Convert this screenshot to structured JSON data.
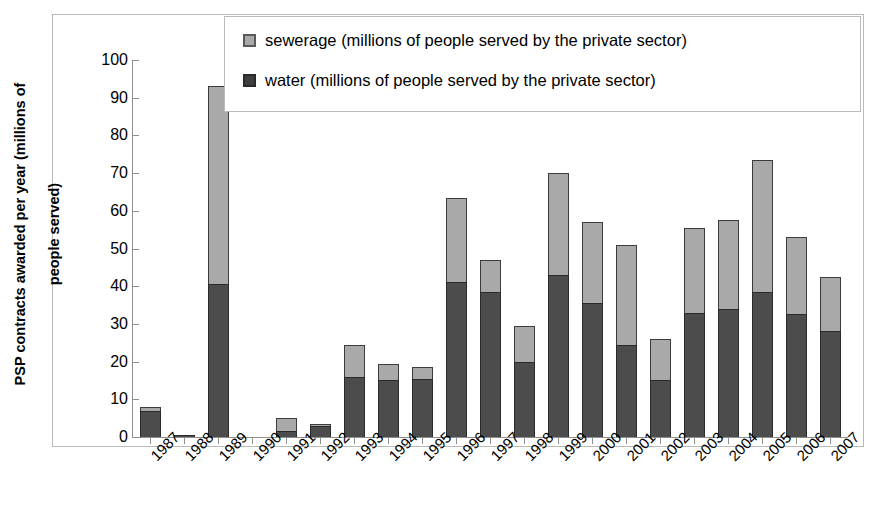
{
  "chart_data": {
    "type": "bar",
    "subtype": "stacked-column",
    "title": "",
    "xlabel": "",
    "ylabel": "PSP contracts awarded per year (millions of people served)",
    "ylim": [
      0,
      100
    ],
    "yticks": [
      100,
      90,
      80,
      70,
      60,
      50,
      40,
      30,
      20,
      10,
      0
    ],
    "grid": false,
    "legend_position": "top-right-inside",
    "categories": [
      "1987",
      "1988",
      "1989",
      "1990",
      "1991",
      "1992",
      "1993",
      "1994",
      "1995",
      "1996",
      "1997",
      "1998",
      "1999",
      "2000",
      "2001",
      "2002",
      "2003",
      "2004",
      "2005",
      "2006",
      "2007"
    ],
    "series": [
      {
        "name": "water (millions of people served by the private sector)",
        "color": "#4c4c4c",
        "values": [
          7.0,
          0.5,
          40.5,
          0.0,
          1.5,
          3.0,
          16.0,
          15.0,
          15.5,
          41.0,
          38.5,
          20.0,
          43.0,
          35.5,
          24.5,
          15.0,
          33.0,
          34.0,
          38.5,
          32.5,
          28.0
        ]
      },
      {
        "name": "sewerage (millions of people served by the private sector)",
        "color": "#a9a9a9",
        "values": [
          1.0,
          0.0,
          52.5,
          0.0,
          3.5,
          0.5,
          8.5,
          4.5,
          3.0,
          22.5,
          8.5,
          9.5,
          27.0,
          21.5,
          26.5,
          11.0,
          22.5,
          23.5,
          35.0,
          20.5,
          14.5
        ]
      }
    ],
    "totals": [
      8.0,
      0.5,
      93.0,
      0.0,
      5.0,
      3.5,
      24.5,
      19.5,
      18.5,
      63.5,
      47.0,
      29.5,
      70.0,
      57.0,
      51.0,
      26.0,
      55.5,
      57.5,
      73.5,
      53.0,
      42.5
    ]
  },
  "axis": {
    "y_title_line1": "PSP contracts awarded per year (millions of",
    "y_title_line2": "people served)"
  },
  "legend": {
    "items": [
      {
        "label": "sewerage (millions of people served by the private sector)",
        "swatch": "legend-swatch-sewerage"
      },
      {
        "label": "water (millions of people served by the private sector)",
        "swatch": "legend-swatch-water"
      }
    ]
  }
}
